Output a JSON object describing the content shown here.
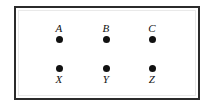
{
  "diagram": {
    "title": "",
    "frame": {
      "border_color": "#2b2b2b",
      "background_color": "#ffffff"
    },
    "dot_color": "#111111",
    "rows": [
      {
        "name": "top-row",
        "label_position": "above",
        "nodes": [
          {
            "label": "A",
            "x": 59,
            "y": 41
          },
          {
            "label": "B",
            "x": 106,
            "y": 41
          },
          {
            "label": "C",
            "x": 152,
            "y": 41
          }
        ]
      },
      {
        "name": "bottom-row",
        "label_position": "below",
        "nodes": [
          {
            "label": "X",
            "x": 59,
            "y": 69
          },
          {
            "label": "Y",
            "x": 106,
            "y": 69
          },
          {
            "label": "Z",
            "x": 152,
            "y": 69
          }
        ]
      }
    ]
  }
}
